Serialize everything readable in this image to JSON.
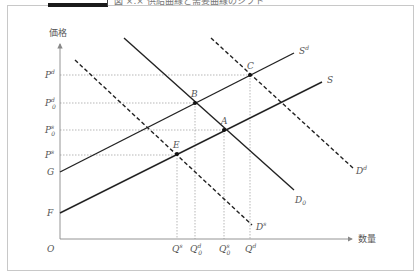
{
  "figure": {
    "title": "図 ×.× 供給曲線と需要曲線のシフト",
    "colors": {
      "frame": "#c8c8c8",
      "curve": "#222222",
      "guide": "#9a9a9a",
      "label": "#555555",
      "title_bar": "#1a1a1a"
    }
  },
  "axes": {
    "y_label": "価格",
    "x_label": "数量",
    "origin": "O"
  },
  "price_levels": [
    {
      "id": "Pd",
      "base": "P",
      "sup": "d",
      "sub": ""
    },
    {
      "id": "Pd0",
      "base": "P",
      "sup": "d",
      "sub": "0"
    },
    {
      "id": "Ps0",
      "base": "P",
      "sup": "s",
      "sub": "0"
    },
    {
      "id": "Ps",
      "base": "P",
      "sup": "s",
      "sub": ""
    }
  ],
  "intercepts": {
    "G": "G",
    "F": "F"
  },
  "quantity_levels": [
    {
      "id": "Qs",
      "base": "Q",
      "sup": "s",
      "sub": ""
    },
    {
      "id": "Qd0",
      "base": "Q",
      "sup": "d",
      "sub": "0"
    },
    {
      "id": "Qs0",
      "base": "Q",
      "sup": "s",
      "sub": "0"
    },
    {
      "id": "Qd",
      "base": "Q",
      "sup": "d",
      "sub": ""
    }
  ],
  "points": {
    "A": "A",
    "B": "B",
    "C": "C",
    "E": "E"
  },
  "curves": {
    "Sd": {
      "base": "S",
      "sup": "d",
      "sub": "",
      "style": "solid"
    },
    "S": {
      "base": "S",
      "sup": "",
      "sub": "",
      "style": "solid"
    },
    "D0": {
      "base": "D",
      "sup": "",
      "sub": "0",
      "style": "solid"
    },
    "Dd": {
      "base": "D",
      "sup": "d",
      "sub": "",
      "style": "dashed"
    },
    "Ds": {
      "base": "D",
      "sup": "s",
      "sub": "",
      "style": "dashed"
    }
  }
}
